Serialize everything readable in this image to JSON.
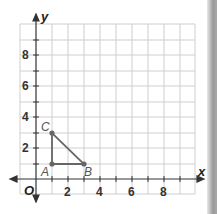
{
  "graph": {
    "axes": {
      "x_label": "x",
      "y_label": "y",
      "origin_label": "O"
    },
    "x_ticks": [
      "2",
      "4",
      "6",
      "8"
    ],
    "y_ticks": [
      "2",
      "4",
      "6",
      "8"
    ],
    "points": [
      {
        "label": "A",
        "x": 1,
        "y": 1
      },
      {
        "label": "B",
        "x": 3,
        "y": 1
      },
      {
        "label": "C",
        "x": 1,
        "y": 3
      }
    ],
    "colors": {
      "grid": "#cfcfcf",
      "axis": "#333333",
      "shape": "#666666"
    }
  }
}
